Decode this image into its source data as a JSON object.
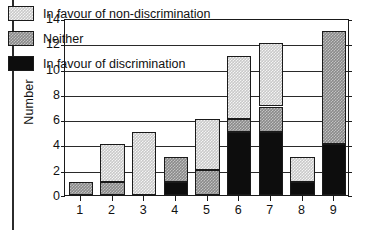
{
  "chart_data": {
    "type": "bar",
    "title": "",
    "subtitle": "",
    "xlabel": "",
    "ylabel": "Number",
    "categories": [
      "1",
      "2",
      "3",
      "4",
      "5",
      "6",
      "7",
      "8",
      "9"
    ],
    "ylim": [
      0,
      14
    ],
    "yticks": [
      0,
      2,
      4,
      6,
      8,
      10,
      12,
      14
    ],
    "ytick_labels": [
      "0",
      "2",
      "4",
      "6",
      "8",
      "10",
      "12",
      "14"
    ],
    "grid": true,
    "stacked": true,
    "legend_position": "inside-top-left",
    "series": [
      {
        "name": "In favour of discrimination",
        "key": "fav-disc",
        "color": "#0d0d0d",
        "values": [
          0,
          0,
          0,
          1,
          0,
          5,
          5,
          1,
          4
        ]
      },
      {
        "name": "Neither",
        "key": "neither",
        "color": "#8a8a8a",
        "values": [
          1,
          1,
          0,
          2,
          2,
          1,
          2,
          0,
          9
        ]
      },
      {
        "name": "In favour of non-discrimination",
        "key": "fav-non",
        "color": "#c9c9c9",
        "values": [
          0,
          3,
          5,
          0,
          4,
          5,
          5,
          2,
          0
        ]
      }
    ],
    "totals": [
      1,
      4,
      5,
      3,
      6,
      11,
      12,
      3,
      13
    ],
    "legend_order": [
      "In favour of non-discrimination",
      "Neither",
      "In favour of discrimination"
    ]
  },
  "legend": {
    "items": [
      {
        "label": "In favour of non-discrimination",
        "swatch": "fav-non"
      },
      {
        "label": "Neither",
        "swatch": "neither"
      },
      {
        "label": "In favour of discrimination",
        "swatch": "fav-disc"
      }
    ]
  },
  "axes": {
    "y_title": "Number"
  }
}
